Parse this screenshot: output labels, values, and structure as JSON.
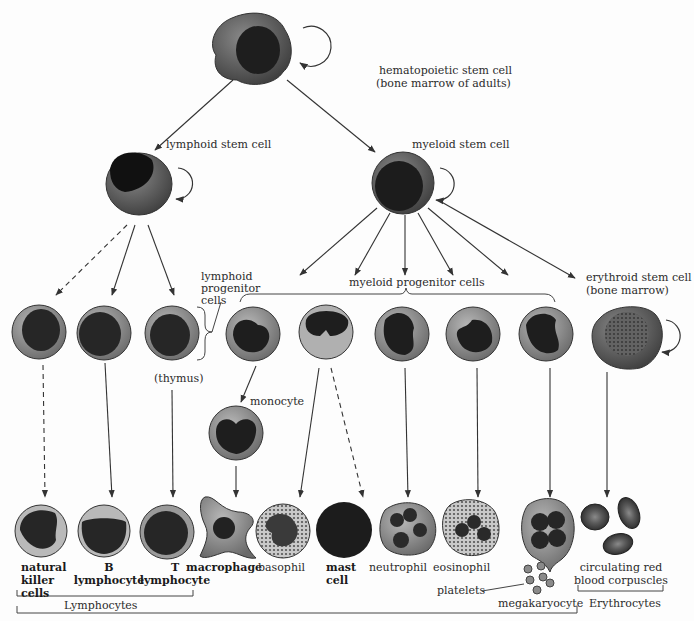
{
  "colors": {
    "background": "#fdfdfd",
    "cytoplasm": "#8a8a8a",
    "cytoplasm_light": "#b4b4b4",
    "nucleus": "#222222",
    "line": "#333333",
    "text": "#2b2b2b"
  },
  "labels": {
    "hsc_line1": "hematopoietic stem cell",
    "hsc_line2": "(bone marrow of adults)",
    "lymphoid_stem": "lymphoid stem cell",
    "myeloid_stem": "myeloid stem cell",
    "lymphoid_prog_1": "lymphoid",
    "lymphoid_prog_2": "progenitor",
    "lymphoid_prog_3": "cells",
    "myeloid_prog": "myeloid progenitor cells",
    "erythroid_1": "erythroid stem cell",
    "erythroid_2": "(bone marrow)",
    "thymus": "(thymus)",
    "monocyte": "monocyte",
    "nk_1": "natural",
    "nk_2": "killer",
    "nk_3": "cells",
    "b_1": "B",
    "b_2": "lymphocyte",
    "t_1": "T",
    "t_2": "lymphocyte",
    "macrophage": "macrophage",
    "basophil": "basophil",
    "mast_1": "mast",
    "mast_2": "cell",
    "neutrophil": "neutrophil",
    "eosinophil": "eosinophil",
    "platelets": "platelets",
    "megakaryocyte": "megakaryocyte",
    "rbc_1": "circulating red",
    "rbc_2": "blood corpuscles",
    "lymphocytes_group": "Lymphocytes",
    "erythrocytes_group": "Erythrocytes"
  }
}
